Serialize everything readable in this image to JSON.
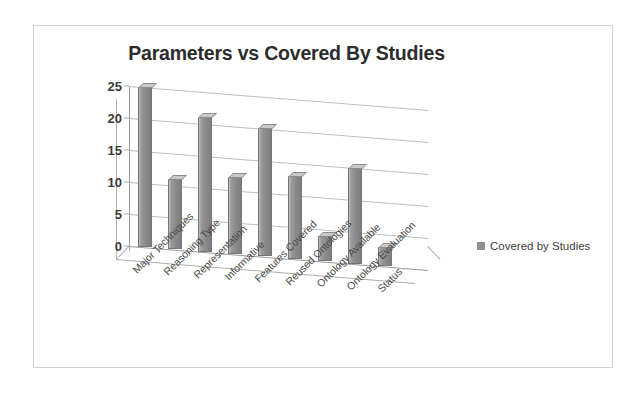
{
  "chart_data": {
    "type": "bar",
    "title": "Parameters vs Covered By Studies",
    "xlabel": "",
    "ylabel": "",
    "ylim": [
      0,
      25
    ],
    "yticks": [
      0,
      5,
      10,
      15,
      20,
      25
    ],
    "grid": true,
    "legend_position": "right",
    "categories": [
      "Major Techniques",
      "Reasoning Type",
      "Representation",
      "Informative",
      "Features Covered",
      "Reused Ontologies",
      "Ontology Available",
      "Ontology Evaluation",
      "Status"
    ],
    "series": [
      {
        "name": "Covered by Studies",
        "values": [
          25,
          11,
          21,
          12,
          20,
          13,
          4,
          15,
          3
        ],
        "color": "#8a8a8a"
      }
    ]
  },
  "legend": {
    "marker": "square-swatch-icon",
    "label": "Covered by Studies"
  },
  "axis": {
    "y_tick_labels": [
      "25",
      "20",
      "15",
      "10",
      "5",
      "0"
    ]
  },
  "colors": {
    "bar": "#8a8a8a",
    "bar_top": "#c9c9c9",
    "gridline": "#bdbdbd",
    "axis": "#9a9a9a",
    "frame_border": "#d2d2d2",
    "title_text": "#2c2c2c",
    "label_text": "#4a4a4a",
    "background": "#ffffff"
  }
}
